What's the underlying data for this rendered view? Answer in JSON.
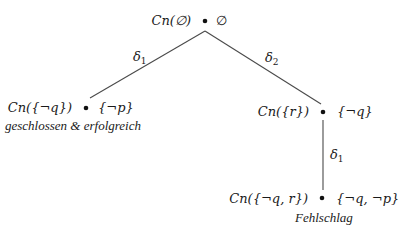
{
  "diagram": {
    "nodes": [
      {
        "id": "root",
        "theory": "Cn(∅)",
        "set": "∅",
        "status": ""
      },
      {
        "id": "left",
        "theory": "Cn({¬q})",
        "set": "{¬p}",
        "status": "geschlossen & erfolgreich"
      },
      {
        "id": "right",
        "theory": "Cn({r})",
        "set": "{¬q}",
        "status": ""
      },
      {
        "id": "bottom",
        "theory": "Cn({¬q, r})",
        "set": "{¬q, ¬p}",
        "status": "Fehlschlag"
      }
    ],
    "edges": [
      {
        "from": "root",
        "to": "left",
        "label": "δ",
        "sub": "1"
      },
      {
        "from": "root",
        "to": "right",
        "label": "δ",
        "sub": "2"
      },
      {
        "from": "right",
        "to": "bottom",
        "label": "δ",
        "sub": "1"
      }
    ]
  }
}
